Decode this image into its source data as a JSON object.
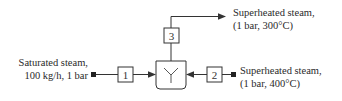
{
  "diagram": {
    "type": "process-flow-mixer",
    "unit": {
      "symbol": "Y",
      "name": "mixer"
    },
    "streams": [
      {
        "id": "1",
        "label": "1",
        "direction": "in",
        "source_label_line1": "Saturated steam,",
        "source_label_line2": "100 kg/h, 1 bar"
      },
      {
        "id": "2",
        "label": "2",
        "direction": "in",
        "source_label_line1": "Superheated steam,",
        "source_label_line2": "(1 bar, 400°C)"
      },
      {
        "id": "3",
        "label": "3",
        "direction": "out",
        "source_label_line1": "Superheated steam,",
        "source_label_line2": "(1 bar, 300°C)"
      }
    ],
    "colors": {
      "line": "#333333",
      "text": "#2a2a2a",
      "background": "#ffffff"
    }
  }
}
